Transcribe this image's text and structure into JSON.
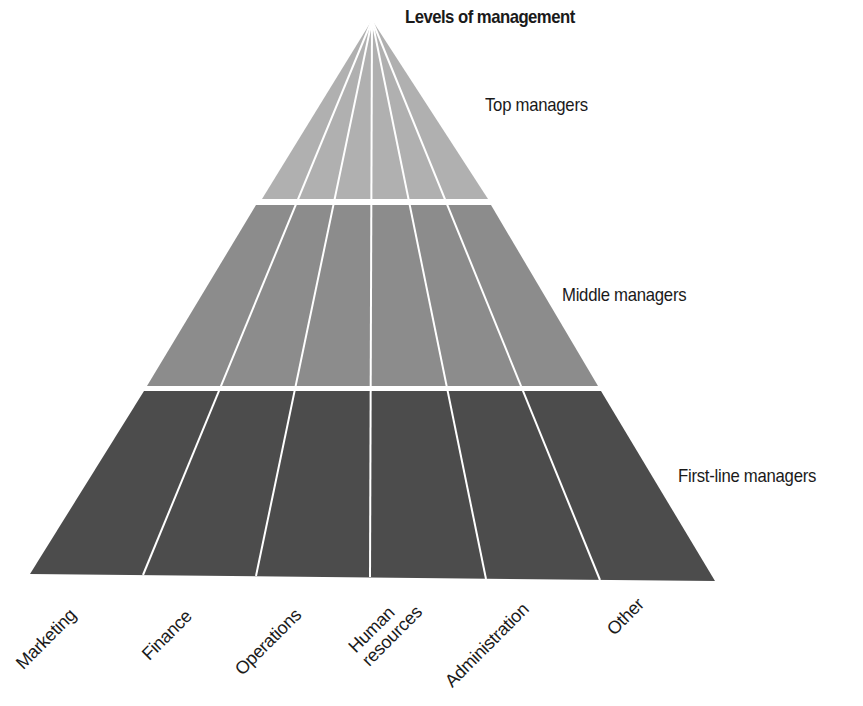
{
  "title": "Levels of management",
  "colors": {
    "top_tier": "#b0b0b0",
    "middle_tier": "#8c8c8c",
    "bottom_tier": "#4c4c4c",
    "divider": "#ffffff"
  },
  "levels": [
    {
      "label": "Top managers",
      "tier": "top"
    },
    {
      "label": "Middle managers",
      "tier": "middle"
    },
    {
      "label": "First-line managers",
      "tier": "bottom"
    }
  ],
  "departments": [
    {
      "label": "Marketing",
      "line2": ""
    },
    {
      "label": "Finance",
      "line2": ""
    },
    {
      "label": "Operations",
      "line2": ""
    },
    {
      "label": "Human",
      "line2": "resources"
    },
    {
      "label": "Administration",
      "line2": ""
    },
    {
      "label": "Other",
      "line2": ""
    }
  ]
}
